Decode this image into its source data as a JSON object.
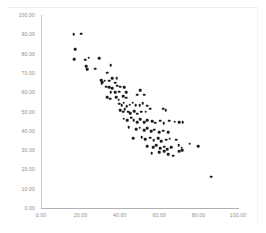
{
  "chart_data": {
    "type": "scatter",
    "title": "",
    "xlabel": "",
    "ylabel": "",
    "xlim": [
      0,
      100
    ],
    "ylim": [
      0,
      100
    ],
    "grid": false,
    "legend": null,
    "x_ticks": [
      "0.00",
      "20.00",
      "40.00",
      "60.00",
      "80.00",
      "100.00"
    ],
    "x_tick_values": [
      0,
      20,
      40,
      60,
      80,
      100
    ],
    "y_ticks": [
      "0.00",
      "10.00",
      "20.00",
      "30.00",
      "40.00",
      "50.00",
      "60.00",
      "70.00",
      "80.00",
      "90.00",
      "100.00"
    ],
    "y_tick_values": [
      0,
      10,
      20,
      30,
      40,
      50,
      60,
      70,
      80,
      90,
      100
    ],
    "marker_color": "#1c1c1c",
    "series": [
      {
        "name": "series-1",
        "points": [
          [
            16.5,
            90.0
          ],
          [
            20.5,
            90.4
          ],
          [
            17.3,
            82.3
          ],
          [
            16.8,
            77.1
          ],
          [
            22.5,
            76.8
          ],
          [
            24.2,
            77.8
          ],
          [
            29.6,
            77.6
          ],
          [
            22.9,
            73.6
          ],
          [
            23.4,
            72.0
          ],
          [
            27.4,
            72.1
          ],
          [
            35.3,
            74.0
          ],
          [
            33.5,
            70.0
          ],
          [
            30.7,
            66.2
          ],
          [
            31.0,
            65.2
          ],
          [
            30.9,
            64.3
          ],
          [
            32.4,
            66.0
          ],
          [
            34.6,
            66.0
          ],
          [
            36.2,
            67.1
          ],
          [
            37.6,
            64.9
          ],
          [
            38.5,
            67.2
          ],
          [
            33.2,
            62.8
          ],
          [
            34.5,
            62.6
          ],
          [
            36.2,
            62.2
          ],
          [
            38.6,
            63.3
          ],
          [
            40.2,
            62.8
          ],
          [
            35.4,
            60.0
          ],
          [
            37.8,
            59.9
          ],
          [
            39.8,
            60.3
          ],
          [
            42.3,
            62.5
          ],
          [
            43.4,
            60.0
          ],
          [
            33.6,
            57.4
          ],
          [
            35.2,
            56.6
          ],
          [
            38.3,
            57.3
          ],
          [
            39.4,
            56.1
          ],
          [
            41.6,
            58.0
          ],
          [
            43.1,
            57.1
          ],
          [
            48.8,
            58.8
          ],
          [
            50.3,
            61.1
          ],
          [
            52.4,
            58.6
          ],
          [
            39.6,
            54.0
          ],
          [
            41.0,
            53.2
          ],
          [
            42.0,
            54.5
          ],
          [
            43.6,
            52.7
          ],
          [
            45.0,
            53.6
          ],
          [
            46.6,
            54.6
          ],
          [
            48.0,
            53.4
          ],
          [
            50.0,
            53.2
          ],
          [
            51.6,
            54.3
          ],
          [
            54.0,
            53.0
          ],
          [
            40.2,
            50.6
          ],
          [
            41.6,
            49.9
          ],
          [
            42.4,
            51.1
          ],
          [
            44.2,
            50.0
          ],
          [
            45.4,
            49.1
          ],
          [
            47.2,
            50.2
          ],
          [
            48.7,
            48.8
          ],
          [
            51.0,
            49.8
          ],
          [
            53.2,
            50.0
          ],
          [
            55.4,
            51.5
          ],
          [
            62.0,
            51.4
          ],
          [
            63.2,
            50.8
          ],
          [
            42.0,
            46.3
          ],
          [
            43.8,
            45.6
          ],
          [
            45.8,
            46.8
          ],
          [
            47.1,
            45.4
          ],
          [
            48.8,
            44.4
          ],
          [
            50.4,
            45.9
          ],
          [
            52.4,
            44.6
          ],
          [
            53.8,
            45.6
          ],
          [
            56.3,
            45.0
          ],
          [
            58.0,
            44.2
          ],
          [
            60.4,
            45.3
          ],
          [
            62.2,
            44.0
          ],
          [
            65.2,
            45.2
          ],
          [
            67.8,
            44.7
          ],
          [
            70.3,
            44.5
          ],
          [
            72.0,
            44.6
          ],
          [
            44.5,
            42.0
          ],
          [
            48.4,
            40.8
          ],
          [
            50.0,
            41.7
          ],
          [
            52.3,
            40.3
          ],
          [
            54.0,
            41.2
          ],
          [
            56.0,
            39.8
          ],
          [
            57.6,
            40.6
          ],
          [
            60.0,
            39.4
          ],
          [
            62.0,
            40.0
          ],
          [
            64.5,
            39.2
          ],
          [
            46.8,
            36.2
          ],
          [
            51.2,
            36.8
          ],
          [
            53.0,
            35.6
          ],
          [
            55.5,
            36.4
          ],
          [
            57.3,
            35.0
          ],
          [
            59.4,
            36.2
          ],
          [
            61.0,
            34.6
          ],
          [
            63.6,
            35.3
          ],
          [
            65.4,
            36.0
          ],
          [
            68.6,
            35.4
          ],
          [
            54.0,
            32.1
          ],
          [
            57.0,
            31.6
          ],
          [
            58.6,
            32.5
          ],
          [
            60.6,
            31.0
          ],
          [
            62.4,
            31.8
          ],
          [
            64.2,
            30.6
          ],
          [
            66.2,
            31.4
          ],
          [
            70.0,
            32.6
          ],
          [
            71.5,
            31.3
          ],
          [
            75.4,
            33.4
          ],
          [
            79.8,
            32.1
          ],
          [
            56.2,
            28.4
          ],
          [
            60.0,
            28.8
          ],
          [
            62.4,
            29.4
          ],
          [
            64.6,
            28.0
          ],
          [
            70.2,
            29.5
          ],
          [
            71.8,
            29.8
          ],
          [
            67.0,
            27.0
          ],
          [
            86.3,
            16.2
          ]
        ]
      }
    ]
  }
}
